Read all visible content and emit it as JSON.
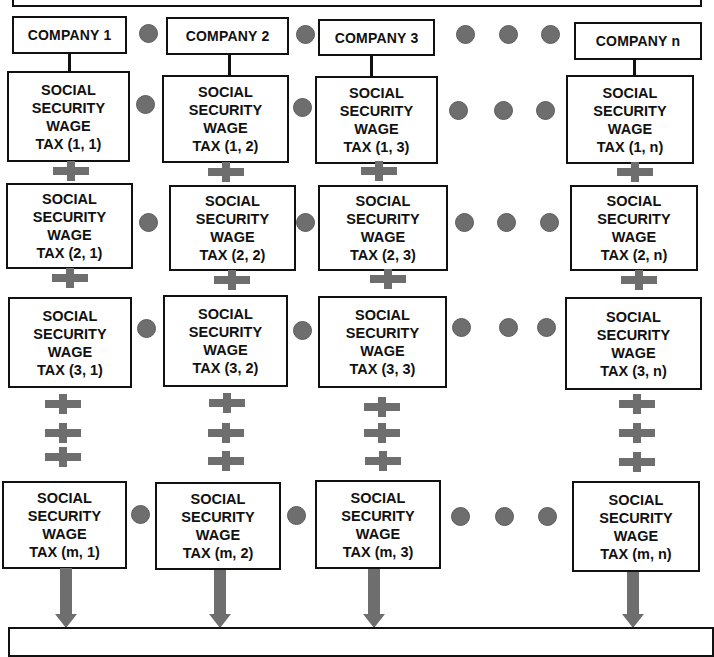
{
  "diagram": {
    "companies": [
      {
        "label": "COMPANY 1"
      },
      {
        "label": "COMPANY 2"
      },
      {
        "label": "COMPANY 3"
      },
      {
        "label": "COMPANY n"
      }
    ],
    "cell_text": {
      "line1": "SOCIAL",
      "line2": "SECURITY",
      "line3": "WAGE"
    },
    "rows": [
      {
        "index": "1",
        "cells": [
          "TAX (1, 1)",
          "TAX (1, 2)",
          "TAX (1, 3)",
          "TAX (1, n)"
        ]
      },
      {
        "index": "2",
        "cells": [
          "TAX (2, 1)",
          "TAX (2, 2)",
          "TAX (2, 3)",
          "TAX (2, n)"
        ]
      },
      {
        "index": "3",
        "cells": [
          "TAX (3, 1)",
          "TAX (3, 2)",
          "TAX (3, 3)",
          "TAX (3, n)"
        ]
      },
      {
        "index": "m",
        "cells": [
          "TAX (m, 1)",
          "TAX (m, 2)",
          "TAX (m, 3)",
          "TAX (m, n)"
        ]
      }
    ],
    "colors": {
      "border": "#111111",
      "connector_gray": "#6e6e6e",
      "background": "#ffffff"
    }
  }
}
